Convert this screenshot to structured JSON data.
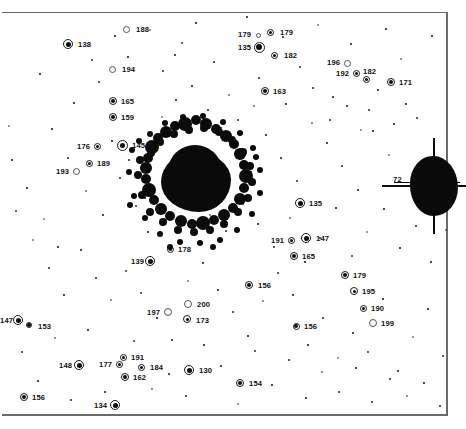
{
  "figure": {
    "type": "astronomical-plate",
    "width": 463,
    "height": 429,
    "background_color": "#ffffff",
    "ink_color": "#0d0d0d",
    "frame_color": "#6a6a6a"
  },
  "chart_data": {
    "type": "scatter",
    "title": "",
    "xlabel": "",
    "ylabel": "",
    "grid": false,
    "legend": null,
    "xlim": [
      0,
      463
    ],
    "ylim": [
      0,
      429
    ],
    "cluster_core": {
      "x": 196,
      "y": 182,
      "radius": 36,
      "label": null
    },
    "saturated_star": {
      "x": 430,
      "y": 186,
      "label": "72",
      "label_x": 393,
      "label_y": 176
    },
    "labels": [
      {
        "id": "188",
        "x": 126,
        "y": 29,
        "lx": 136,
        "ly": 26,
        "marker": "open",
        "size": 6,
        "ring": 7
      },
      {
        "id": "138",
        "x": 68,
        "y": 44,
        "lx": 78,
        "ly": 41,
        "marker": "filled",
        "size": 5,
        "ring": 10
      },
      {
        "id": "179",
        "x": 258,
        "y": 35,
        "lx": 238,
        "ly": 31,
        "marker": "open",
        "size": 4,
        "ring": 5
      },
      {
        "id": "179",
        "x": 270,
        "y": 32,
        "lx": 280,
        "ly": 29,
        "marker": "dotted",
        "size": 3,
        "ring": 7
      },
      {
        "id": "135",
        "x": 259,
        "y": 47,
        "lx": 238,
        "ly": 44,
        "marker": "filled",
        "size": 6,
        "ring": 11
      },
      {
        "id": "182",
        "x": 274,
        "y": 55,
        "lx": 284,
        "ly": 52,
        "marker": "dotted",
        "size": 3,
        "ring": 7
      },
      {
        "id": "196",
        "x": 347,
        "y": 63,
        "lx": 327,
        "ly": 59,
        "marker": "open",
        "size": 2,
        "ring": 7
      },
      {
        "id": "194",
        "x": 112,
        "y": 69,
        "lx": 122,
        "ly": 66,
        "marker": "open",
        "size": 3,
        "ring": 7
      },
      {
        "id": "192",
        "x": 356,
        "y": 73,
        "lx": 336,
        "ly": 70,
        "marker": "dotted",
        "size": 3,
        "ring": 7
      },
      {
        "id": "182",
        "x": 366,
        "y": 79,
        "lx": 363,
        "ly": 68,
        "marker": "dotted",
        "size": 3,
        "ring": 7
      },
      {
        "id": "171",
        "x": 391,
        "y": 82,
        "lx": 399,
        "ly": 79,
        "marker": "dotted",
        "size": 4,
        "ring": 8
      },
      {
        "id": "163",
        "x": 265,
        "y": 91,
        "lx": 273,
        "ly": 88,
        "marker": "dotted",
        "size": 4,
        "ring": 8
      },
      {
        "id": "165",
        "x": 113,
        "y": 101,
        "lx": 121,
        "ly": 98,
        "marker": "dotted",
        "size": 4,
        "ring": 8
      },
      {
        "id": "159",
        "x": 113,
        "y": 117,
        "lx": 121,
        "ly": 114,
        "marker": "dotted",
        "size": 4,
        "ring": 8
      },
      {
        "id": "176",
        "x": 97,
        "y": 146,
        "lx": 77,
        "ly": 143,
        "marker": "dotted",
        "size": 3,
        "ring": 7
      },
      {
        "id": "145",
        "x": 122,
        "y": 145,
        "lx": 132,
        "ly": 142,
        "marker": "filled",
        "size": 5,
        "ring": 11
      },
      {
        "id": "189",
        "x": 89,
        "y": 163,
        "lx": 97,
        "ly": 160,
        "marker": "dotted",
        "size": 3,
        "ring": 7
      },
      {
        "id": "193",
        "x": 76,
        "y": 171,
        "lx": 56,
        "ly": 168,
        "marker": "open",
        "size": 2,
        "ring": 7
      },
      {
        "id": "135",
        "x": 300,
        "y": 203,
        "lx": 309,
        "ly": 200,
        "marker": "filled",
        "size": 5,
        "ring": 10
      },
      {
        "id": "191",
        "x": 291,
        "y": 240,
        "lx": 271,
        "ly": 237,
        "marker": "dotted",
        "size": 3,
        "ring": 7
      },
      {
        "id": "147",
        "x": 306,
        "y": 238,
        "lx": 316,
        "ly": 235,
        "marker": "filled",
        "size": 5,
        "ring": 10
      },
      {
        "id": "178",
        "x": 170,
        "y": 249,
        "lx": 178,
        "ly": 246,
        "marker": "dotted",
        "size": 3,
        "ring": 7
      },
      {
        "id": "139",
        "x": 150,
        "y": 261,
        "lx": 131,
        "ly": 258,
        "marker": "filled",
        "size": 5,
        "ring": 10
      },
      {
        "id": "165",
        "x": 294,
        "y": 256,
        "lx": 302,
        "ly": 253,
        "marker": "dotted",
        "size": 4,
        "ring": 8
      },
      {
        "id": "179",
        "x": 345,
        "y": 275,
        "lx": 353,
        "ly": 272,
        "marker": "dotted",
        "size": 4,
        "ring": 8
      },
      {
        "id": "156",
        "x": 249,
        "y": 285,
        "lx": 258,
        "ly": 282,
        "marker": "dotted",
        "size": 4,
        "ring": 8
      },
      {
        "id": "195",
        "x": 354,
        "y": 291,
        "lx": 362,
        "ly": 288,
        "marker": "dotted",
        "size": 3,
        "ring": 8
      },
      {
        "id": "190",
        "x": 363,
        "y": 308,
        "lx": 371,
        "ly": 305,
        "marker": "dotted",
        "size": 3,
        "ring": 7
      },
      {
        "id": "200",
        "x": 188,
        "y": 304,
        "lx": 197,
        "ly": 301,
        "marker": "open",
        "size": 2,
        "ring": 8
      },
      {
        "id": "197",
        "x": 168,
        "y": 312,
        "lx": 147,
        "ly": 309,
        "marker": "open",
        "size": 2,
        "ring": 8
      },
      {
        "id": "147",
        "x": 18,
        "y": 320,
        "lx": 0,
        "ly": 317,
        "marker": "filled",
        "size": 5,
        "ring": 10
      },
      {
        "id": "173",
        "x": 187,
        "y": 319,
        "lx": 196,
        "ly": 317,
        "marker": "dotted",
        "size": 3,
        "ring": 8
      },
      {
        "id": "199",
        "x": 373,
        "y": 323,
        "lx": 381,
        "ly": 320,
        "marker": "open",
        "size": 2,
        "ring": 8
      },
      {
        "id": "153",
        "x": 29,
        "y": 325,
        "lx": 38,
        "ly": 323,
        "marker": "filled",
        "size": 4,
        "ring": 6
      },
      {
        "id": "156",
        "x": 296,
        "y": 326,
        "lx": 304,
        "ly": 323,
        "marker": "dotted",
        "size": 4,
        "ring": 7
      },
      {
        "id": "191",
        "x": 123,
        "y": 357,
        "lx": 131,
        "ly": 354,
        "marker": "dotted",
        "size": 3,
        "ring": 7
      },
      {
        "id": "177",
        "x": 119,
        "y": 364,
        "lx": 99,
        "ly": 361,
        "marker": "dotted",
        "size": 3,
        "ring": 7
      },
      {
        "id": "148",
        "x": 79,
        "y": 365,
        "lx": 59,
        "ly": 362,
        "marker": "filled",
        "size": 5,
        "ring": 10
      },
      {
        "id": "184",
        "x": 141,
        "y": 367,
        "lx": 150,
        "ly": 364,
        "marker": "dotted",
        "size": 3,
        "ring": 7
      },
      {
        "id": "130",
        "x": 189,
        "y": 370,
        "lx": 199,
        "ly": 367,
        "marker": "filled",
        "size": 5,
        "ring": 10
      },
      {
        "id": "162",
        "x": 125,
        "y": 377,
        "lx": 133,
        "ly": 374,
        "marker": "dotted",
        "size": 4,
        "ring": 8
      },
      {
        "id": "154",
        "x": 240,
        "y": 383,
        "lx": 249,
        "ly": 380,
        "marker": "dotted",
        "size": 4,
        "ring": 8
      },
      {
        "id": "156",
        "x": 24,
        "y": 397,
        "lx": 32,
        "ly": 394,
        "marker": "dotted",
        "size": 4,
        "ring": 8
      },
      {
        "id": "134",
        "x": 115,
        "y": 405,
        "lx": 94,
        "ly": 402,
        "marker": "filled",
        "size": 5,
        "ring": 10
      }
    ],
    "field_stars": [
      [
        9,
        126
      ],
      [
        40,
        74
      ],
      [
        74,
        103
      ],
      [
        99,
        82
      ],
      [
        128,
        57
      ],
      [
        150,
        30
      ],
      [
        163,
        71
      ],
      [
        182,
        43
      ],
      [
        196,
        23
      ],
      [
        214,
        62
      ],
      [
        229,
        95
      ],
      [
        247,
        17
      ],
      [
        259,
        78
      ],
      [
        283,
        37
      ],
      [
        300,
        67
      ],
      [
        318,
        25
      ],
      [
        333,
        97
      ],
      [
        351,
        44
      ],
      [
        369,
        110
      ],
      [
        386,
        29
      ],
      [
        401,
        59
      ],
      [
        417,
        118
      ],
      [
        432,
        36
      ],
      [
        52,
        129
      ],
      [
        68,
        158
      ],
      [
        86,
        191
      ],
      [
        103,
        215
      ],
      [
        120,
        178
      ],
      [
        136,
        206
      ],
      [
        148,
        232
      ],
      [
        162,
        117
      ],
      [
        176,
        100
      ],
      [
        192,
        86
      ],
      [
        208,
        110
      ],
      [
        221,
        128
      ],
      [
        236,
        150
      ],
      [
        251,
        172
      ],
      [
        266,
        135
      ],
      [
        281,
        158
      ],
      [
        297,
        181
      ],
      [
        312,
        123
      ],
      [
        327,
        143
      ],
      [
        342,
        166
      ],
      [
        358,
        190
      ],
      [
        373,
        131
      ],
      [
        389,
        155
      ],
      [
        406,
        104
      ],
      [
        421,
        173
      ],
      [
        436,
        202
      ],
      [
        16,
        211
      ],
      [
        33,
        240
      ],
      [
        49,
        268
      ],
      [
        64,
        295
      ],
      [
        81,
        250
      ],
      [
        96,
        278
      ],
      [
        111,
        300
      ],
      [
        126,
        271
      ],
      [
        141,
        293
      ],
      [
        157,
        318
      ],
      [
        172,
        340
      ],
      [
        188,
        281
      ],
      [
        203,
        263
      ],
      [
        218,
        290
      ],
      [
        233,
        312
      ],
      [
        248,
        336
      ],
      [
        263,
        301
      ],
      [
        278,
        273
      ],
      [
        293,
        295
      ],
      [
        308,
        345
      ],
      [
        323,
        318
      ],
      [
        338,
        358
      ],
      [
        353,
        333
      ],
      [
        368,
        352
      ],
      [
        383,
        299
      ],
      [
        398,
        371
      ],
      [
        413,
        337
      ],
      [
        428,
        309
      ],
      [
        443,
        356
      ],
      [
        22,
        352
      ],
      [
        38,
        381
      ],
      [
        55,
        338
      ],
      [
        71,
        400
      ],
      [
        88,
        330
      ],
      [
        105,
        392
      ],
      [
        134,
        341
      ],
      [
        152,
        389
      ],
      [
        169,
        374
      ],
      [
        186,
        396
      ],
      [
        204,
        345
      ],
      [
        221,
        366
      ],
      [
        238,
        404
      ],
      [
        255,
        351
      ],
      [
        272,
        385
      ],
      [
        289,
        360
      ],
      [
        306,
        398
      ],
      [
        322,
        372
      ],
      [
        339,
        392
      ],
      [
        356,
        368
      ],
      [
        372,
        402
      ],
      [
        390,
        379
      ],
      [
        407,
        396
      ],
      [
        424,
        383
      ],
      [
        440,
        406
      ],
      [
        12,
        160
      ],
      [
        27,
        188
      ],
      [
        44,
        219
      ],
      [
        58,
        247
      ],
      [
        112,
        141
      ],
      [
        129,
        160
      ],
      [
        145,
        198
      ],
      [
        210,
        215
      ],
      [
        226,
        231
      ],
      [
        243,
        204
      ],
      [
        258,
        224
      ],
      [
        274,
        247
      ],
      [
        290,
        218
      ],
      [
        305,
        262
      ],
      [
        320,
        238
      ],
      [
        336,
        208
      ],
      [
        352,
        256
      ],
      [
        367,
        232
      ],
      [
        384,
        209
      ],
      [
        400,
        248
      ],
      [
        416,
        226
      ],
      [
        431,
        262
      ],
      [
        446,
        230
      ],
      [
        92,
        60
      ],
      [
        115,
        36
      ],
      [
        175,
        55
      ],
      [
        238,
        120
      ],
      [
        254,
        106
      ],
      [
        286,
        104
      ],
      [
        313,
        88
      ],
      [
        330,
        120
      ],
      [
        347,
        106
      ],
      [
        361,
        130
      ],
      [
        378,
        90
      ],
      [
        394,
        124
      ]
    ],
    "core_blobs": [
      [
        152,
        147,
        7
      ],
      [
        158,
        138,
        5
      ],
      [
        166,
        132,
        6
      ],
      [
        175,
        126,
        5
      ],
      [
        185,
        124,
        7
      ],
      [
        196,
        120,
        5
      ],
      [
        206,
        124,
        6
      ],
      [
        216,
        129,
        5
      ],
      [
        226,
        136,
        6
      ],
      [
        234,
        144,
        5
      ],
      [
        240,
        154,
        6
      ],
      [
        244,
        165,
        5
      ],
      [
        246,
        176,
        7
      ],
      [
        244,
        188,
        5
      ],
      [
        240,
        199,
        6
      ],
      [
        233,
        208,
        5
      ],
      [
        224,
        215,
        6
      ],
      [
        214,
        220,
        5
      ],
      [
        203,
        223,
        7
      ],
      [
        192,
        224,
        5
      ],
      [
        181,
        221,
        6
      ],
      [
        170,
        216,
        5
      ],
      [
        161,
        209,
        6
      ],
      [
        154,
        200,
        5
      ],
      [
        149,
        190,
        7
      ],
      [
        146,
        179,
        5
      ],
      [
        146,
        168,
        6
      ],
      [
        148,
        158,
        5
      ],
      [
        140,
        160,
        4
      ],
      [
        138,
        175,
        4
      ],
      [
        142,
        195,
        4
      ],
      [
        150,
        212,
        4
      ],
      [
        163,
        222,
        4
      ],
      [
        178,
        230,
        4
      ],
      [
        194,
        232,
        4
      ],
      [
        210,
        230,
        4
      ],
      [
        224,
        224,
        4
      ],
      [
        238,
        212,
        4
      ],
      [
        248,
        198,
        4
      ],
      [
        252,
        182,
        4
      ],
      [
        250,
        166,
        4
      ],
      [
        243,
        152,
        4
      ],
      [
        232,
        140,
        4
      ],
      [
        219,
        132,
        4
      ],
      [
        204,
        128,
        4
      ],
      [
        189,
        130,
        4
      ],
      [
        174,
        134,
        4
      ],
      [
        160,
        142,
        4
      ],
      [
        151,
        153,
        4
      ],
      [
        132,
        150,
        3
      ],
      [
        129,
        172,
        3
      ],
      [
        134,
        196,
        3
      ],
      [
        145,
        218,
        3
      ],
      [
        160,
        234,
        3
      ],
      [
        180,
        242,
        3
      ],
      [
        200,
        243,
        3
      ],
      [
        220,
        240,
        3
      ],
      [
        237,
        230,
        3
      ],
      [
        252,
        214,
        3
      ],
      [
        260,
        193,
        3
      ],
      [
        260,
        170,
        3
      ],
      [
        253,
        148,
        3
      ],
      [
        240,
        133,
        3
      ],
      [
        223,
        122,
        3
      ],
      [
        203,
        116,
        3
      ],
      [
        183,
        117,
        3
      ],
      [
        165,
        123,
        3
      ],
      [
        150,
        134,
        3
      ],
      [
        139,
        141,
        3
      ],
      [
        256,
        157,
        3
      ],
      [
        130,
        205,
        3
      ],
      [
        170,
        247,
        3
      ],
      [
        213,
        247,
        3
      ]
    ]
  }
}
